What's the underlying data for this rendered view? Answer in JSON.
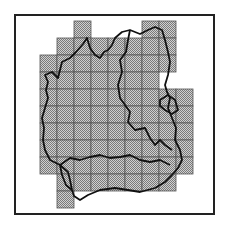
{
  "map": {
    "type": "grid-coverage-map",
    "cell_size": 17,
    "origin": {
      "x": 40,
      "y": 21
    },
    "colors": {
      "frame": "#222222",
      "cell_fill": "#b8b8b8",
      "grid_line": "#555555",
      "boundary": "#111111"
    },
    "rows": [
      [
        2,
        6,
        7
      ],
      [
        1,
        2,
        3,
        4,
        5,
        6,
        7
      ],
      [
        0,
        1,
        2,
        3,
        4,
        5,
        6,
        7
      ],
      [
        0,
        1,
        2,
        3,
        4,
        5,
        6
      ],
      [
        0,
        1,
        2,
        3,
        4,
        5,
        6,
        7,
        8
      ],
      [
        0,
        1,
        2,
        3,
        4,
        5,
        6,
        7,
        8
      ],
      [
        0,
        1,
        2,
        3,
        4,
        5,
        6,
        7,
        8
      ],
      [
        0,
        1,
        2,
        3,
        4,
        5,
        6,
        7,
        8
      ],
      [
        0,
        1,
        2,
        3,
        4,
        5,
        6,
        7,
        8
      ],
      [
        1,
        2,
        3,
        4,
        5,
        6,
        7
      ],
      [
        1
      ]
    ]
  }
}
